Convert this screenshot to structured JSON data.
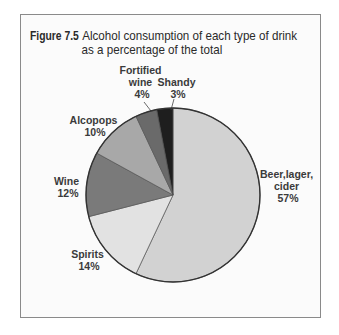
{
  "figure": {
    "number": "Figure 7.5",
    "title_line1": "Alcohol consumption of each type of drink",
    "title_line2": "as a percentage of the total"
  },
  "chart_data": {
    "type": "pie",
    "start_angle": "12 o'clock, clockwise",
    "unit": "%",
    "categories": [
      "Beer, lager, cider",
      "Spirits",
      "Wine",
      "Alcopops",
      "Fortified wine",
      "Shandy"
    ],
    "values": [
      57,
      14,
      12,
      10,
      4,
      3
    ],
    "colors": [
      "#d2d2d2",
      "#e2e2e2",
      "#7a7a7a",
      "#a8a8a8",
      "#6a6a6a",
      "#1e1e1e"
    ],
    "labels": [
      {
        "lines": [
          "Beer,lager,",
          "cider",
          "57%"
        ]
      },
      {
        "lines": [
          "Spirits",
          "14%"
        ]
      },
      {
        "lines": [
          "Wine",
          "12%"
        ]
      },
      {
        "lines": [
          "Alcopops",
          "10%"
        ]
      },
      {
        "lines": [
          "Fortified",
          "wine",
          "4%"
        ]
      },
      {
        "lines": [
          "Shandy",
          "3%"
        ]
      }
    ],
    "legend": "none (direct labels)"
  }
}
